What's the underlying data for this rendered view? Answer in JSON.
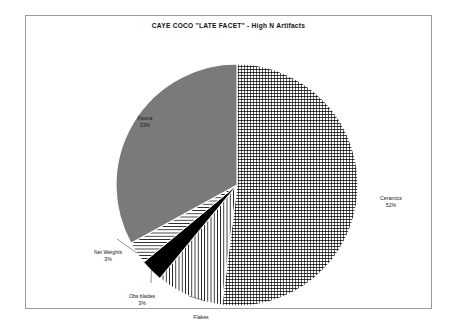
{
  "chart_data": {
    "type": "pie",
    "title": "CAYE COCO \"LATE FACET\" - High N Artifacts",
    "categories": [
      "Ceramics",
      "Flakes",
      "Obs blades",
      "Net Weights",
      "Fauna"
    ],
    "values": [
      52,
      9,
      3,
      3,
      33
    ],
    "labels": [
      {
        "name": "Ceramics",
        "pct_text": "52%",
        "value": 52,
        "pattern": "cross-hatch-grid",
        "color": "#000000"
      },
      {
        "name": "Flakes",
        "pct_text": "",
        "value": 9,
        "pattern": "vertical-lines",
        "color": "#000000"
      },
      {
        "name": "Obs blades",
        "pct_text": "3%",
        "value": 3,
        "pattern": "solid-black",
        "color": "#000000"
      },
      {
        "name": "Net Weights",
        "pct_text": "3%",
        "value": 3,
        "pattern": "horizontal-lines",
        "color": "#000000"
      },
      {
        "name": "Fauna",
        "pct_text": "33%",
        "value": 33,
        "pattern": "solid-gray",
        "color": "#7a7a7a"
      }
    ],
    "start_angle_deg": 0,
    "direction": "clockwise",
    "legend": "none",
    "grid": false,
    "xlabel": "",
    "ylabel": ""
  },
  "frame": {
    "border_color": "#9a9a9a",
    "background": "#ffffff"
  }
}
